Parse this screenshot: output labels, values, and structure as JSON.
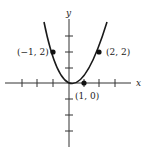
{
  "diagram": {
    "type": "function-graph",
    "function": "y = x^2 - x",
    "axes": {
      "x_label": "x",
      "y_label": "y",
      "x_ticks": [
        -3,
        -2,
        -1,
        1,
        2,
        3
      ],
      "y_ticks": [
        -3,
        -2,
        -1,
        1,
        2,
        3
      ]
    },
    "points": [
      {
        "x": -1,
        "y": 2,
        "label": "(−1, 2)"
      },
      {
        "x": 1,
        "y": 0,
        "label": "(1, 0)"
      },
      {
        "x": 2,
        "y": 2,
        "label": "(2, 2)"
      }
    ],
    "colors": {
      "curve": "#1a1a1a",
      "axes": "#333333"
    }
  }
}
